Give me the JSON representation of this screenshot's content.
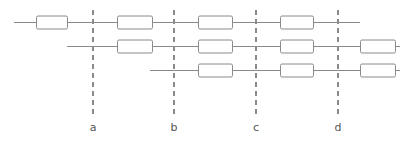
{
  "diagram": {
    "canvas": {
      "width": 412,
      "height": 144,
      "background": "#ffffff"
    },
    "colors": {
      "line": "#8a8a8a",
      "block_stroke": "#8a8a8a",
      "block_fill": "#ffffff",
      "label_text": "#555555",
      "marker": "#8a8a8a"
    },
    "tracks": [
      {
        "name": "track-1",
        "y": 22,
        "x_start": 14,
        "x_end": 360,
        "blocks": [
          {
            "name": "block-1-1",
            "x": 36,
            "width": 31,
            "height": 13
          },
          {
            "name": "block-1-2",
            "x": 117,
            "width": 35,
            "height": 13
          },
          {
            "name": "block-1-3",
            "x": 198,
            "width": 34,
            "height": 13
          },
          {
            "name": "block-1-4",
            "x": 280,
            "width": 33,
            "height": 13
          }
        ]
      },
      {
        "name": "track-2",
        "y": 46,
        "x_start": 67,
        "x_end": 400,
        "blocks": [
          {
            "name": "block-2-1",
            "x": 117,
            "width": 35,
            "height": 13
          },
          {
            "name": "block-2-2",
            "x": 198,
            "width": 34,
            "height": 13
          },
          {
            "name": "block-2-3",
            "x": 280,
            "width": 33,
            "height": 13
          },
          {
            "name": "block-2-4",
            "x": 360,
            "width": 35,
            "height": 13
          }
        ]
      },
      {
        "name": "track-3",
        "y": 70,
        "x_start": 150,
        "x_end": 400,
        "blocks": [
          {
            "name": "block-3-1",
            "x": 198,
            "width": 34,
            "height": 13
          },
          {
            "name": "block-3-2",
            "x": 280,
            "width": 33,
            "height": 13
          },
          {
            "name": "block-3-3",
            "x": 360,
            "width": 35,
            "height": 13
          }
        ]
      }
    ],
    "markers": [
      {
        "name": "marker-a",
        "label": "a",
        "x": 93,
        "y_top": 10,
        "y_bottom": 118,
        "label_y": 131
      },
      {
        "name": "marker-b",
        "label": "b",
        "x": 174,
        "y_top": 10,
        "y_bottom": 118,
        "label_y": 131
      },
      {
        "name": "marker-c",
        "label": "c",
        "x": 256,
        "y_top": 10,
        "y_bottom": 118,
        "label_y": 131
      },
      {
        "name": "marker-d",
        "label": "d",
        "x": 338,
        "y_top": 10,
        "y_bottom": 118,
        "label_y": 131
      }
    ]
  }
}
